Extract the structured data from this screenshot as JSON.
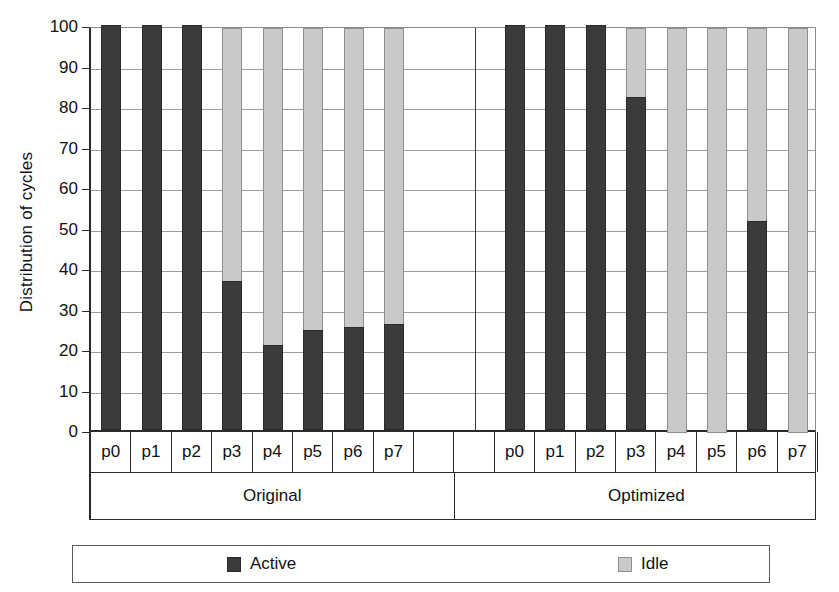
{
  "chart_data": {
    "type": "bar",
    "subtype": "stacked-100-percent",
    "title": "",
    "xlabel": "",
    "ylabel": "Distribution of cycles",
    "ylim": [
      0,
      100
    ],
    "ytick_step": 10,
    "yticks": [
      100,
      90,
      80,
      70,
      60,
      50,
      40,
      30,
      20,
      10,
      0
    ],
    "grid": true,
    "legend_position": "bottom",
    "categories": [
      "p0",
      "p1",
      "p2",
      "p3",
      "p4",
      "p5",
      "p6",
      "p7"
    ],
    "groups": [
      "Original",
      "Optimized"
    ],
    "series": [
      {
        "name": "Active",
        "color": "#3b3b3b",
        "values_by_group": {
          "Original": [
            100,
            100,
            100,
            36.8,
            21.0,
            24.7,
            25.5,
            26.2
          ],
          "Optimized": [
            100,
            100,
            100,
            82.2,
            0,
            0,
            51.6,
            0
          ]
        }
      },
      {
        "name": "Idle",
        "color": "#c9c9c9",
        "values_by_group": {
          "Original": [
            0,
            0,
            0,
            63.2,
            79.0,
            75.3,
            74.5,
            73.8
          ],
          "Optimized": [
            0,
            0,
            0,
            17.8,
            100,
            100,
            48.4,
            100
          ]
        }
      }
    ]
  },
  "axis": {
    "y_title": "Distribution of cycles"
  },
  "legend": {
    "items": [
      {
        "label": "Active",
        "swatch": "active-swatch"
      },
      {
        "label": "Idle",
        "swatch": "idle-swatch"
      }
    ]
  }
}
